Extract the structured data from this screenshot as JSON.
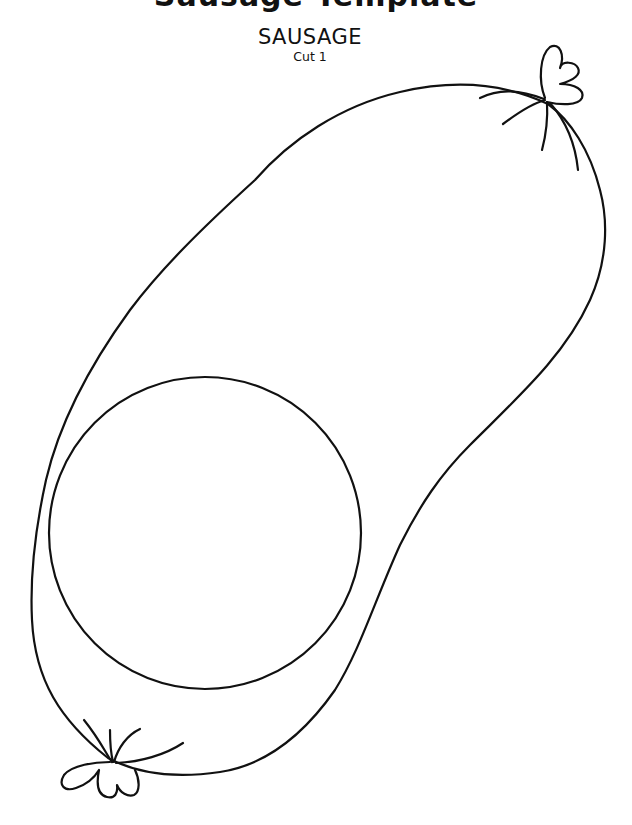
{
  "header": {
    "cutoff_title": "Sausage Template",
    "title": "SAUSAGE",
    "subtitle": "Cut 1"
  },
  "illustration": {
    "subject": "sausage-outline",
    "cut_circle": {
      "cx": 205,
      "cy": 533,
      "r": 156
    },
    "stroke_color": "#111111",
    "background_color": "#ffffff"
  }
}
